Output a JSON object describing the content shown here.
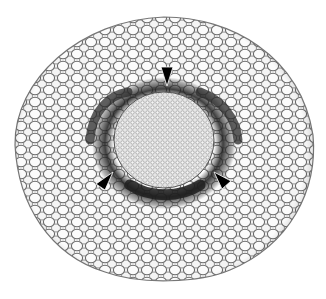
{
  "image": {
    "subject": "transverse section of plant root/stem, cellular micrograph",
    "background": "#ffffff",
    "section": {
      "cx": 164,
      "cy": 150,
      "rx": 149,
      "ry": 133,
      "fill": "#f2f2f2",
      "wall_color": "#5a5a5a"
    },
    "stele": {
      "cx": 164,
      "cy": 140,
      "rx": 47,
      "ry": 45,
      "fill": "#d8d8d8"
    },
    "dark_band": {
      "color": "#2a2a2a"
    },
    "arrowheads": [
      {
        "name": "top",
        "points": "161,67 173,67 167,86",
        "color": "#000000"
      },
      {
        "name": "bottom-left",
        "points": "96,184 112,173 104,190",
        "color": "#000000"
      },
      {
        "name": "bottom-right",
        "points": "214,172 230,180 222,188",
        "color": "#000000"
      }
    ]
  }
}
